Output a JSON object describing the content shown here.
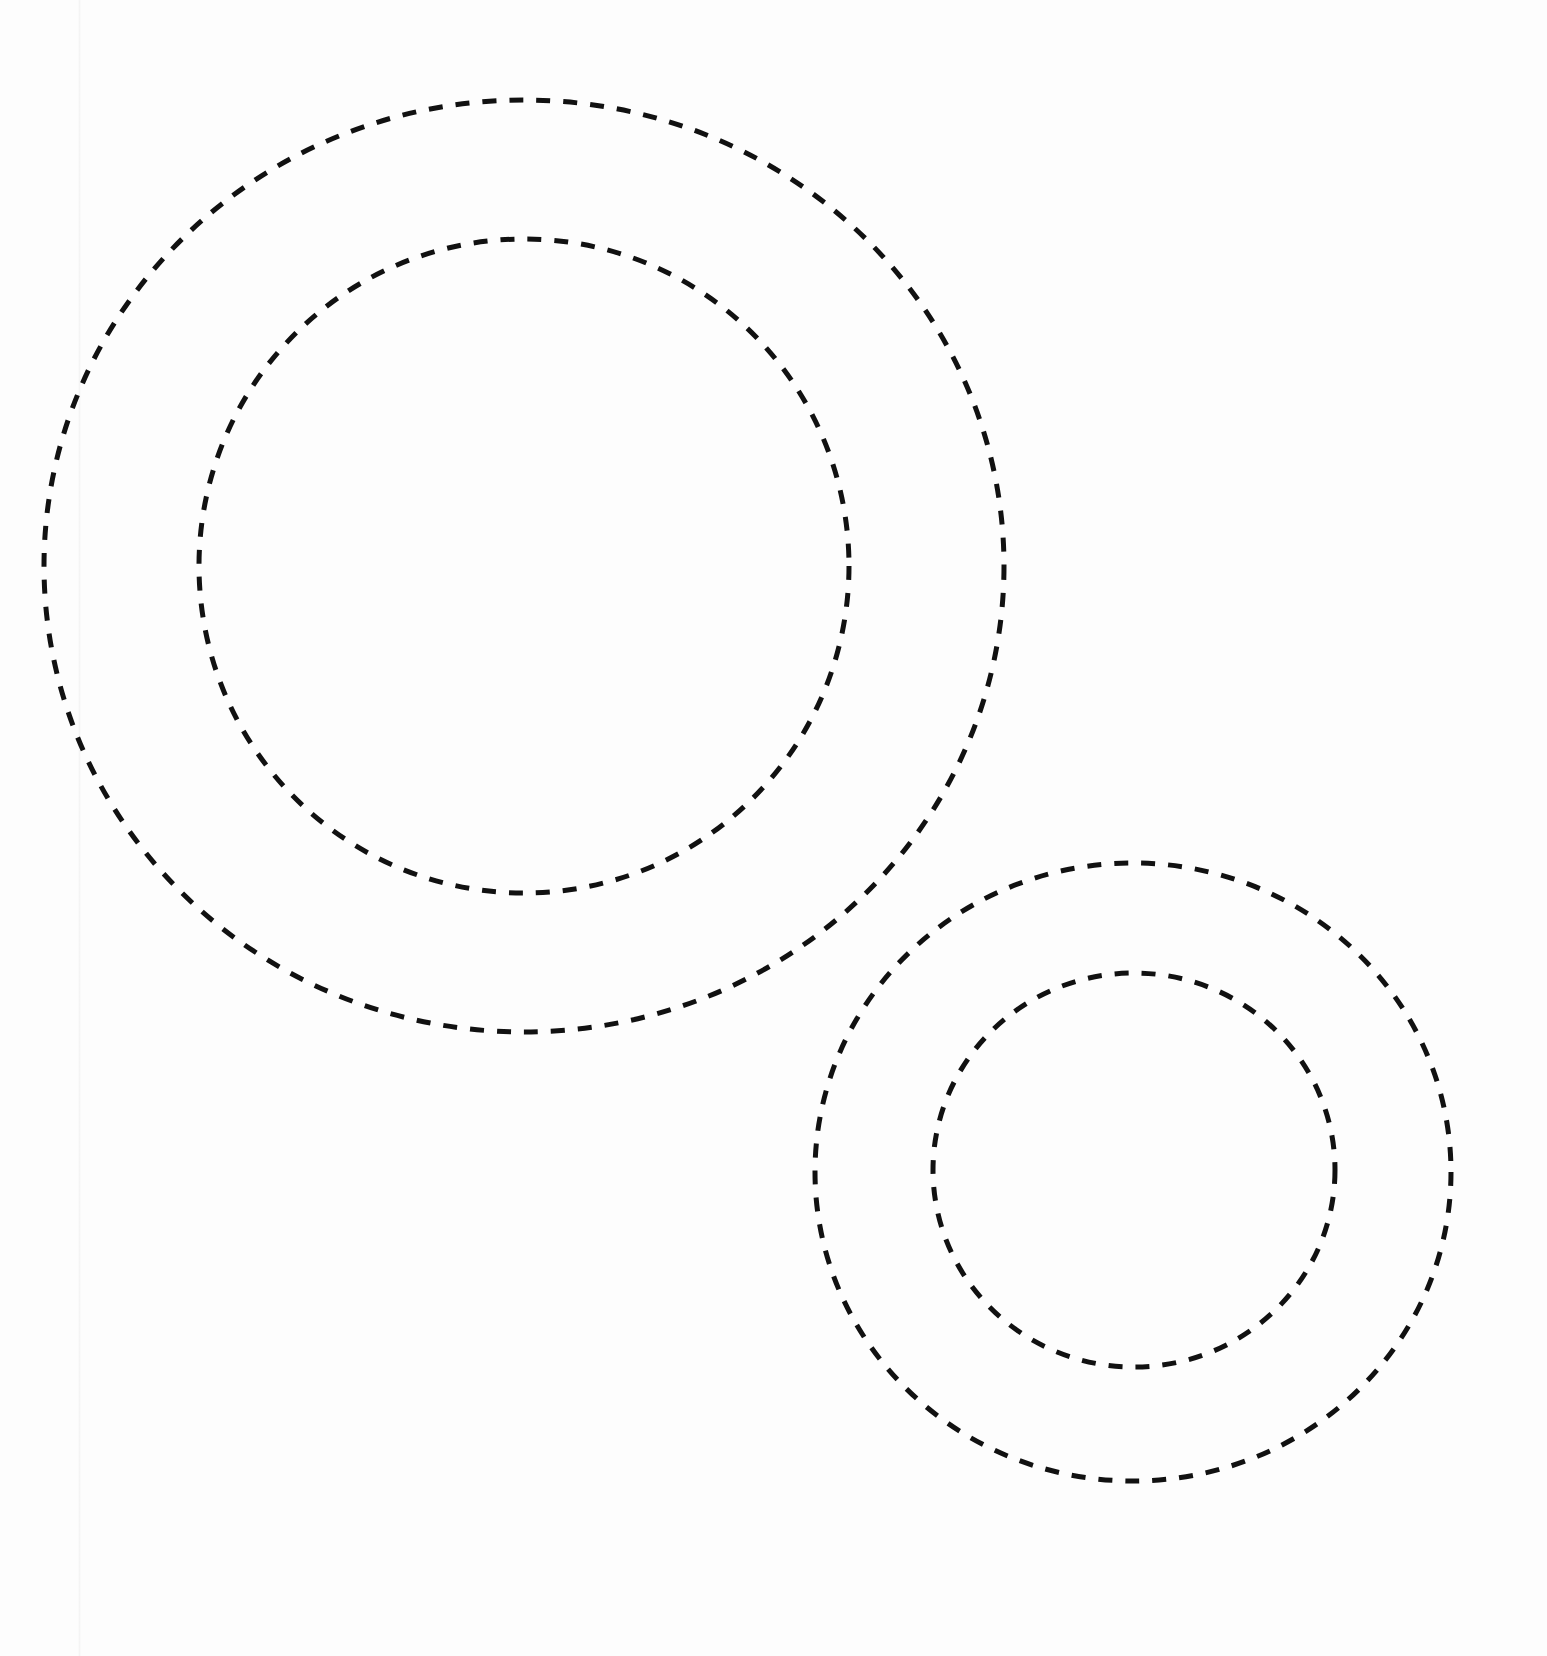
{
  "diagram": {
    "background": "#fdfdfd",
    "stroke_color": "#111111",
    "stroke_width": 5,
    "dash_pattern": "14 13",
    "groups": [
      {
        "name": "large-concentric-pair",
        "circles": [
          {
            "role": "outer",
            "cx": 524,
            "cy": 566,
            "rx": 480,
            "ry": 466
          },
          {
            "role": "inner",
            "cx": 524,
            "cy": 566,
            "rx": 325,
            "ry": 327
          }
        ]
      },
      {
        "name": "small-concentric-pair",
        "circles": [
          {
            "role": "outer",
            "cx": 1133,
            "cy": 1172,
            "rx": 318,
            "ry": 309
          },
          {
            "role": "inner",
            "cx": 1134,
            "cy": 1170,
            "rx": 201,
            "ry": 197
          }
        ]
      }
    ]
  }
}
